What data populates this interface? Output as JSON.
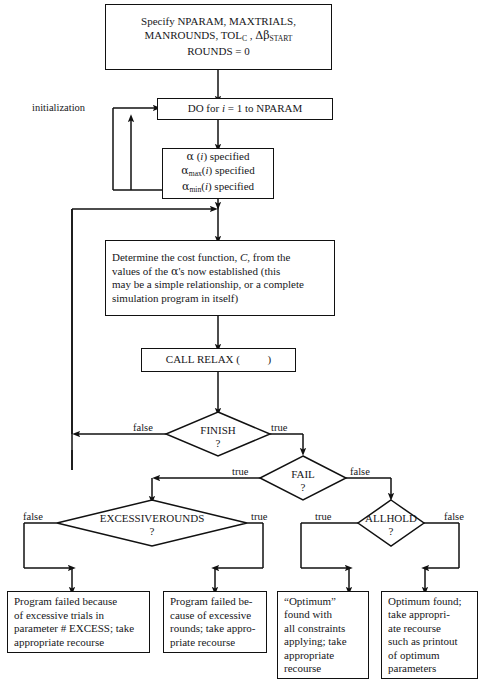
{
  "labels": {
    "initialization": "initialization"
  },
  "nodes": {
    "specify": {
      "type": "process",
      "lines": [
        "Specify NPARAM, MAXTRIALS,",
        "MANROUNDS, TOL_C , Δβ_START",
        "ROUNDS = 0"
      ]
    },
    "do_loop": {
      "type": "process",
      "lines": [
        "DO for i = 1 to  NPARAM"
      ]
    },
    "alpha": {
      "type": "process",
      "lines": [
        "α (i) specified",
        "αmax(i) specified",
        "αmin(i) specified"
      ]
    },
    "cost": {
      "type": "process",
      "lines": [
        "Determine the cost function, C, from the",
        "values of the α's now established (this",
        "may be a simple relationship, or a complete",
        "simulation program in itself)"
      ]
    },
    "call_relax": {
      "type": "process",
      "lines": [
        "CALL RELAX (            )"
      ]
    },
    "finish": {
      "type": "decision",
      "label": "FINISH",
      "question": "?"
    },
    "fail": {
      "type": "decision",
      "label": "FAIL",
      "question": "?"
    },
    "excessiverounds": {
      "type": "decision",
      "label": "EXCESSIVEROUNDS",
      "question": "?"
    },
    "allhold": {
      "type": "decision",
      "label": "ALLHOLD",
      "question": "?"
    },
    "term_trials": {
      "type": "terminal",
      "lines": [
        "Program failed because",
        "of excessive trials in",
        "parameter # EXCESS; take",
        "appropriate recourse"
      ]
    },
    "term_rounds": {
      "type": "terminal",
      "lines": [
        "Program failed be-",
        "cause of excessive",
        "rounds; take appro-",
        "priate recourse"
      ]
    },
    "term_optimum_quoted": {
      "type": "terminal",
      "lines": [
        "“Optimum”",
        "found with",
        "all constraints",
        "applying; take",
        "appropriate",
        "recourse"
      ]
    },
    "term_optimum_found": {
      "type": "terminal",
      "lines": [
        "Optimum found;",
        "take appropri-",
        "ate recourse",
        "such as printout",
        "of optimum",
        "parameters"
      ]
    }
  },
  "edges": {
    "finish_false": "false",
    "finish_true": "true",
    "fail_true": "true",
    "fail_false": "false",
    "excessiverounds_false": "false",
    "excessiverounds_true": "true",
    "allhold_true": "true",
    "allhold_false": "false"
  },
  "colors": {
    "stroke": "#111111",
    "text": "#17171a",
    "background": "#ffffff"
  }
}
